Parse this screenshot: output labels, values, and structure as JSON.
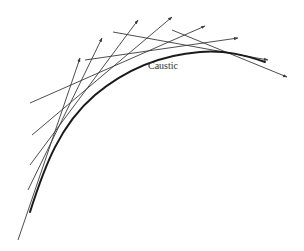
{
  "diagram": {
    "title": "Caustic",
    "label": {
      "text": "Caustic",
      "x": 148,
      "y": 60
    },
    "colors": {
      "ray": "#3a3a3a",
      "caustic": "#1a1a1a",
      "background": "#ffffff"
    },
    "caustic_curve": {
      "path": "M 30 212 C 45 165, 60 125, 95 95 C 125 70, 160 55, 200 52 C 225 50, 245 55, 265 62"
    },
    "rays": [
      {
        "id": "ray-1",
        "x1": 18,
        "y1": 240,
        "x2": 80,
        "y2": 58
      },
      {
        "id": "ray-2",
        "x1": 28,
        "y1": 190,
        "x2": 102,
        "y2": 38
      },
      {
        "id": "ray-3",
        "x1": 30,
        "y1": 165,
        "x2": 138,
        "y2": 20
      },
      {
        "id": "ray-4",
        "x1": 32,
        "y1": 135,
        "x2": 172,
        "y2": 17
      },
      {
        "id": "ray-5",
        "x1": 30,
        "y1": 103,
        "x2": 205,
        "y2": 26
      },
      {
        "id": "ray-6",
        "x1": 85,
        "y1": 60,
        "x2": 238,
        "y2": 38
      },
      {
        "id": "ray-7",
        "x1": 113,
        "y1": 32,
        "x2": 268,
        "y2": 60
      },
      {
        "id": "ray-8",
        "x1": 172,
        "y1": 30,
        "x2": 287,
        "y2": 77
      }
    ]
  }
}
